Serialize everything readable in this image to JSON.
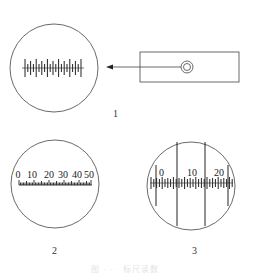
{
  "figure": {
    "panels": [
      {
        "label": "1",
        "description": "eyepiece view with scale graticule, arrow from instrument"
      },
      {
        "label": "2",
        "description": "reticle with numbered scale",
        "scale_labels": [
          "0",
          "10",
          "20",
          "30",
          "40",
          "50"
        ]
      },
      {
        "label": "3",
        "description": "reticle with scale and vertical hairlines",
        "scale_labels": [
          "0",
          "10",
          "20"
        ]
      }
    ],
    "caption": "图 · · · 标尺读数"
  },
  "colors": {
    "line": "#333333",
    "background": "#ffffff"
  }
}
